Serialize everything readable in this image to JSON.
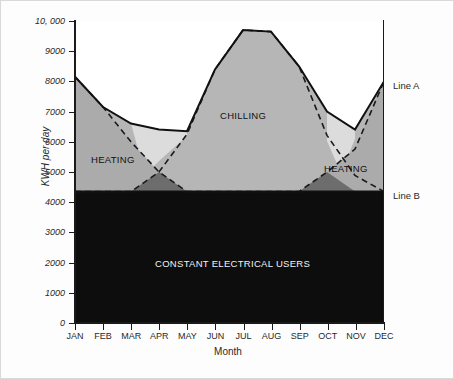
{
  "chart_data": {
    "type": "area",
    "title": "",
    "xlabel": "Month",
    "ylabel": "KWH per day",
    "ylim": [
      0,
      10000
    ],
    "grid": false,
    "legend_position": "right-outside",
    "categories": [
      "JAN",
      "FEB",
      "MAR",
      "APR",
      "MAY",
      "JUN",
      "JUL",
      "AUG",
      "SEP",
      "OCT",
      "NOV",
      "DEC"
    ],
    "y_ticks": [
      {
        "value": 10000,
        "label": "10, 000"
      },
      {
        "value": 9000,
        "label": "9000"
      },
      {
        "value": 8000,
        "label": "8000"
      },
      {
        "value": 7000,
        "label": "7000"
      },
      {
        "value": 6000,
        "label": "6000"
      },
      {
        "value": 5000,
        "label": "5000"
      },
      {
        "value": 4000,
        "label": "4000"
      },
      {
        "value": 3000,
        "label": "3000"
      },
      {
        "value": 2000,
        "label": "2000"
      },
      {
        "value": 1000,
        "label": "1000"
      },
      {
        "value": 0,
        "label": "0"
      }
    ],
    "series": [
      {
        "name": "Line A",
        "style": "solid",
        "description": "Total load (top envelope of stacked areas)",
        "values": [
          8150,
          7150,
          6600,
          6400,
          6350,
          8400,
          9700,
          9650,
          8500,
          7000,
          6400,
          8000
        ]
      },
      {
        "name": "Line B",
        "style": "solid",
        "description": "Constant electrical users baseline",
        "values": [
          4350,
          4350,
          4350,
          4350,
          4350,
          4350,
          4350,
          4350,
          4350,
          4350,
          4350,
          4350
        ]
      },
      {
        "name": "HEATING",
        "style": "dashed",
        "description": "Heating demand, falls to baseline in warm months and rises again in late autumn",
        "values": [
          8150,
          7150,
          6000,
          5000,
          4350,
          4350,
          4350,
          4350,
          4350,
          5000,
          6050,
          8000
        ]
      },
      {
        "name": "CHILLING",
        "style": "dashed",
        "description": "Chilling demand, rises from baseline in spring, peaks midsummer, falls in autumn",
        "values": [
          4350,
          4350,
          4350,
          5000,
          6200,
          8400,
          9700,
          9650,
          8500,
          6100,
          4900,
          4350
        ]
      }
    ],
    "area_labels": [
      {
        "name": "CHILLING",
        "text": "CHILLING"
      },
      {
        "name": "HEATING_LEFT",
        "text": "HEATING"
      },
      {
        "name": "HEATING_RIGHT",
        "text": "HEATING"
      },
      {
        "name": "CONSTANT",
        "text": "CONSTANT ELECTRICAL USERS"
      }
    ],
    "callouts": [
      {
        "name": "Line A",
        "text": "Line A",
        "value": 8000
      },
      {
        "name": "Line B",
        "text": "Line B",
        "value": 4350
      }
    ],
    "colors": {
      "constant_fill": "#0d0d0d",
      "chilling_fill": "#b6b6b6",
      "heating_fill": "#ababab",
      "overlap_fill": "#6d6d6d",
      "pale_fill": "#dcdcdc",
      "plot_background": "#ffffff",
      "axis": "#1a1a1a",
      "text": "#2a2a2a"
    }
  },
  "axis": {
    "y_title": "KWH per day",
    "x_title": "Month"
  },
  "labels": {
    "chilling": "CHILLING",
    "heating_left": "HEATING",
    "heating_right": "HEATING",
    "constant": "CONSTANT ELECTRICAL USERS",
    "line_a": "Line A",
    "line_b": "Line B"
  }
}
